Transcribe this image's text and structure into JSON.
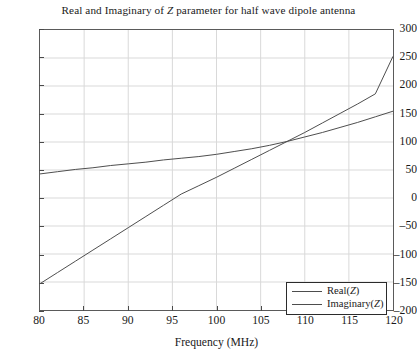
{
  "chart_data": {
    "type": "line",
    "title": "Real and Imaginary of Z parameter for half wave dipole antenna",
    "title_italic_token": "Z",
    "xlabel": "Frequency (MHz)",
    "ylabel": "",
    "xlim": [
      80,
      120
    ],
    "ylim": [
      -200,
      300
    ],
    "xticks": [
      80,
      85,
      90,
      95,
      100,
      105,
      110,
      115,
      120
    ],
    "yticks": [
      300,
      250,
      200,
      150,
      100,
      50,
      0,
      -50,
      -100,
      -150,
      -200
    ],
    "xtick_labels": [
      "80",
      "85",
      "90",
      "95",
      "100",
      "105",
      "110",
      "115",
      "120"
    ],
    "ytick_labels": [
      "300",
      "250",
      "200",
      "150",
      "100",
      "50",
      "0",
      "-50",
      "-100",
      "-150",
      "-200"
    ],
    "grid": true,
    "grid_color": "#d9d9d9",
    "axis_color": "#5a5a5a",
    "legend_position": "lower right",
    "x": [
      80,
      82,
      84,
      86,
      88,
      90,
      92,
      94,
      96,
      98,
      100,
      102,
      104,
      106,
      108,
      110,
      112,
      114,
      116,
      118,
      120
    ],
    "series": [
      {
        "name": "Real(Z)",
        "name_prefix": "Real(",
        "name_italic": "Z",
        "name_suffix": ")",
        "color": "#4d4d4d",
        "values": [
          43,
          47,
          51,
          54,
          58,
          61,
          64,
          68,
          71,
          74,
          78,
          83,
          88,
          94,
          101,
          109,
          117,
          126,
          135,
          145,
          155
        ]
      },
      {
        "name": "Imaginary(Z)",
        "name_prefix": "Imaginary(",
        "name_italic": "Z",
        "name_suffix": ")",
        "color": "#4d4d4d",
        "values": [
          -153,
          -133,
          -113,
          -93,
          -73,
          -53,
          -33,
          -13,
          7,
          22,
          37,
          53,
          69,
          85,
          101,
          117,
          134,
          151,
          168,
          186,
          253
        ]
      }
    ]
  }
}
